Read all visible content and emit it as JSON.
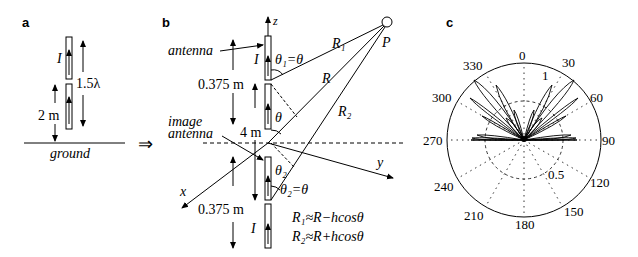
{
  "panels": {
    "a": {
      "label": "a",
      "current_label": "I",
      "length_label": "1.5λ",
      "height_label": "2 m",
      "ground_label": "ground"
    },
    "implies": "⇒",
    "b": {
      "label": "b",
      "z_label": "z",
      "x_label": "x",
      "y_label": "y",
      "antenna_label": "antenna",
      "image_antenna_label_1": "image",
      "image_antenna_label_2": "antenna",
      "current_top": "I",
      "current_bottom": "I",
      "theta1_label": "θ₁=θ",
      "theta_label": "θ",
      "theta2_label": "θ₂",
      "theta2_eq_label": "θ₂=θ",
      "dist_top": "0.375 m",
      "dist_mid": "4 m",
      "dist_bottom": "0.375 m",
      "R1_label": "R₁",
      "R_label": "R",
      "R2_label": "R₂",
      "P_label": "P",
      "eq1": "R₁≈R−hcosθ",
      "eq2": "R₂≈R+hcosθ"
    },
    "c": {
      "label": "c",
      "angle_ticks": [
        "0",
        "30",
        "60",
        "90",
        "120",
        "150",
        "180",
        "210",
        "240",
        "270",
        "300",
        "330"
      ],
      "radial_ticks": [
        "0.5",
        "1"
      ]
    }
  }
}
